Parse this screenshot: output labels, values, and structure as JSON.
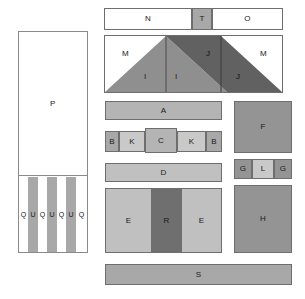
{
  "diagram": {
    "palette": {
      "white": "#ffffff",
      "light_gray": "#c9c9c9",
      "mid_gray": "#b4b4b4",
      "medium_gray": "#a8a8a8",
      "dark_gray": "#8f8f8f",
      "darker_gray": "#6f6f6f",
      "very_dark_gray": "#616161",
      "outline": "#6e6e6e",
      "panel_outline": "#8a8a8a",
      "text": "#1a1a1a"
    },
    "top_bar": {
      "name": "top-bar",
      "segments": [
        {
          "label": "N",
          "fill": "#ffffff",
          "x": 104,
          "y": 8,
          "w": 88,
          "h": 22
        },
        {
          "label": "T",
          "fill": "#a8a8a8",
          "x": 192,
          "y": 8,
          "w": 20,
          "h": 22
        },
        {
          "label": "O",
          "fill": "#ffffff",
          "x": 212,
          "y": 8,
          "w": 71,
          "h": 22
        }
      ]
    },
    "gable": {
      "name": "gable-section",
      "frame": {
        "x": 104,
        "y": 35,
        "w": 179,
        "h": 58
      },
      "labels": [
        {
          "label": "M",
          "x": 122,
          "y": 50
        },
        {
          "label": "M",
          "x": 260,
          "y": 50
        },
        {
          "label": "J",
          "x": 206,
          "y": 50
        },
        {
          "label": "I",
          "x": 144,
          "y": 73
        },
        {
          "label": "I",
          "x": 175,
          "y": 73
        },
        {
          "label": "J",
          "x": 236,
          "y": 73
        }
      ],
      "shapes": [
        {
          "name": "left-slope-light",
          "fill": "#8f8f8f"
        },
        {
          "name": "right-slope-dark",
          "fill": "#616161"
        }
      ]
    },
    "left_panel": {
      "name": "left-panel",
      "outline": {
        "x": 18,
        "y": 31,
        "w": 70,
        "h": 222
      },
      "upper": {
        "label": "P",
        "fill": "#ffffff",
        "x": 18,
        "y": 31,
        "w": 70,
        "h": 145
      },
      "lower": {
        "x": 18,
        "y": 176,
        "w": 70,
        "h": 77
      },
      "stripes": [
        {
          "label": "Q",
          "fill": "#ffffff",
          "x": 19,
          "y": 177,
          "w": 9,
          "h": 75
        },
        {
          "label": "U",
          "fill": "#a8a8a8",
          "x": 28,
          "y": 177,
          "w": 10,
          "h": 75
        },
        {
          "label": "Q",
          "fill": "#ffffff",
          "x": 38,
          "y": 177,
          "w": 9,
          "h": 75
        },
        {
          "label": "U",
          "fill": "#a8a8a8",
          "x": 47,
          "y": 177,
          "w": 10,
          "h": 75
        },
        {
          "label": "Q",
          "fill": "#ffffff",
          "x": 57,
          "y": 177,
          "w": 9,
          "h": 75
        },
        {
          "label": "U",
          "fill": "#a8a8a8",
          "x": 66,
          "y": 177,
          "w": 10,
          "h": 75
        },
        {
          "label": "Q",
          "fill": "#ffffff",
          "x": 76,
          "y": 177,
          "w": 11,
          "h": 75
        }
      ]
    },
    "center_column": {
      "name": "center-column",
      "rows": [
        {
          "name": "row-a",
          "blocks": [
            {
              "label": "A",
              "fill": "#b4b4b4",
              "x": 105,
              "y": 101,
              "w": 117,
              "h": 19
            }
          ]
        },
        {
          "name": "row-bkckb",
          "blocks": [
            {
              "label": "B",
              "fill": "#a8a8a8",
              "x": 105,
              "y": 131,
              "w": 14,
              "h": 21
            },
            {
              "label": "K",
              "fill": "#c9c9c9",
              "x": 119,
              "y": 131,
              "w": 26,
              "h": 21
            },
            {
              "label": "C",
              "fill": "#b4b4b4",
              "x": 145,
              "y": 128,
              "w": 32,
              "h": 25
            },
            {
              "label": "K",
              "fill": "#c9c9c9",
              "x": 177,
              "y": 131,
              "w": 29,
              "h": 21
            },
            {
              "label": "B",
              "fill": "#a8a8a8",
              "x": 206,
              "y": 131,
              "w": 16,
              "h": 21
            }
          ]
        },
        {
          "name": "row-d",
          "blocks": [
            {
              "label": "D",
              "fill": "#c0c0c0",
              "x": 105,
              "y": 163,
              "w": 117,
              "h": 19
            }
          ]
        },
        {
          "name": "row-ere",
          "blocks": [
            {
              "label": "E",
              "fill": "#c0c0c0",
              "x": 105,
              "y": 188,
              "w": 47,
              "h": 65
            },
            {
              "label": "R",
              "fill": "#6f6f6f",
              "x": 152,
              "y": 188,
              "w": 29,
              "h": 65
            },
            {
              "label": "E",
              "fill": "#c0c0c0",
              "x": 181,
              "y": 188,
              "w": 41,
              "h": 65
            }
          ]
        }
      ]
    },
    "right_column": {
      "name": "right-column",
      "blocks": [
        {
          "label": "F",
          "fill": "#949494",
          "x": 234,
          "y": 101,
          "w": 58,
          "h": 52
        },
        {
          "label": "G",
          "fill": "#949494",
          "x": 234,
          "y": 159,
          "w": 18,
          "h": 20
        },
        {
          "label": "L",
          "fill": "#c9c9c9",
          "x": 252,
          "y": 159,
          "w": 22,
          "h": 20
        },
        {
          "label": "G",
          "fill": "#949494",
          "x": 274,
          "y": 159,
          "w": 18,
          "h": 20
        },
        {
          "label": "H",
          "fill": "#949494",
          "x": 234,
          "y": 185,
          "w": 58,
          "h": 68
        }
      ]
    },
    "bottom_bar": {
      "name": "bottom-bar",
      "blocks": [
        {
          "label": "S",
          "fill": "#a8a8a8",
          "x": 105,
          "y": 264,
          "w": 187,
          "h": 21
        }
      ]
    }
  }
}
